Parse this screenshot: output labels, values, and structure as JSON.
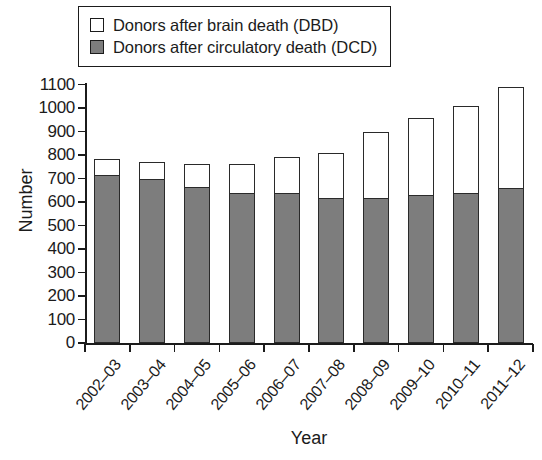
{
  "legend": {
    "items": [
      {
        "label": "Donors after brain death (DBD)",
        "swatch": "white",
        "color": "#ffffff"
      },
      {
        "label": "Donors after circulatory death (DCD)",
        "swatch": "grey",
        "color": "#7d7d7d"
      }
    ]
  },
  "axes": {
    "ylabel": "Number",
    "xlabel": "Year",
    "yticks": [
      "1100",
      "1000",
      "900",
      "800",
      "700",
      "600",
      "500",
      "400",
      "300",
      "200",
      "100",
      "0"
    ]
  },
  "chart_data": {
    "type": "bar",
    "subtype": "stacked",
    "title": "",
    "xlabel": "Year",
    "ylabel": "Number",
    "ylim": [
      0,
      1100
    ],
    "ytick_step": 100,
    "grid": false,
    "legend_position": "top-left",
    "categories": [
      "2002–03",
      "2003–04",
      "2004–05",
      "2005–06",
      "2006–07",
      "2007–08",
      "2008–09",
      "2009–10",
      "2010–11",
      "2011–12"
    ],
    "series": [
      {
        "name": "Donors after circulatory death (DCD)",
        "color": "#7d7d7d",
        "values": [
          716,
          700,
          665,
          640,
          638,
          615,
          615,
          630,
          640,
          660
        ]
      },
      {
        "name": "Donors after brain death (DBD)",
        "color": "#ffffff",
        "values": [
          67,
          72,
          97,
          122,
          155,
          194,
          284,
          329,
          370,
          428
        ]
      }
    ],
    "totals": [
      783,
      772,
      762,
      762,
      793,
      809,
      899,
      959,
      1010,
      1088
    ]
  }
}
